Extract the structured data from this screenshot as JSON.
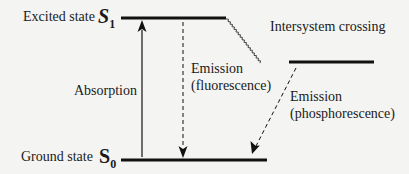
{
  "diagram": {
    "type": "Jablonski energy diagram",
    "states": {
      "excited": {
        "label": "Excited state",
        "symbol": "S",
        "subscript": "1"
      },
      "ground": {
        "label": "Ground state",
        "symbol": "S",
        "subscript": "0"
      },
      "triplet": {
        "label": ""
      }
    },
    "transitions": {
      "absorption": {
        "label": "Absorption"
      },
      "fluorescence": {
        "line1": "Emission",
        "line2": "(fluorescence)"
      },
      "isc": {
        "label": "Intersystem crossing"
      },
      "phosphorescence": {
        "line1": "Emission",
        "line2": "(phosphorescence)"
      }
    },
    "colors": {
      "line": "#111111",
      "background": "#f4f4f2"
    }
  }
}
